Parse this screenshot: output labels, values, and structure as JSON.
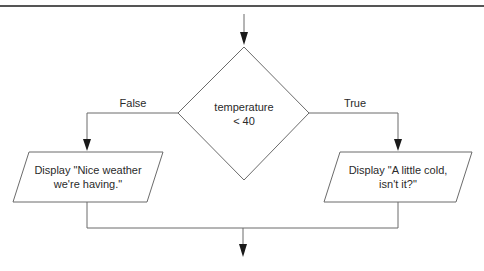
{
  "diagram": {
    "type": "flowchart",
    "colors": {
      "stroke": "#6b6b6b",
      "arrow": "#1a1a1a",
      "top_rule": "#555555",
      "text": "#2a2a2a",
      "background": "#ffffff"
    },
    "decision": {
      "line1": "temperature",
      "line2": "< 40"
    },
    "branches": {
      "false_label": "False",
      "true_label": "True"
    },
    "outputs": {
      "false_box": {
        "line1": "Display \"Nice weather",
        "line2": "we're having.\""
      },
      "true_box": {
        "line1": "Display \"A little cold,",
        "line2": "isn't it?\""
      }
    }
  }
}
